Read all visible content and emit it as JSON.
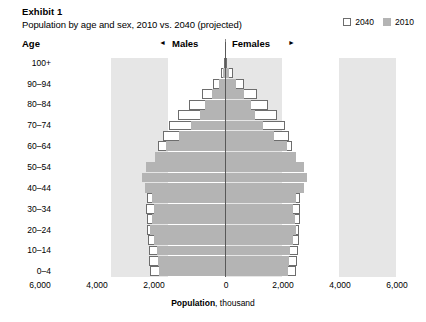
{
  "header": {
    "exhibit": "Exhibit 1",
    "subtitle": "Population by age and sex, 2010 vs. 2040 (projected)"
  },
  "legend": {
    "position": "top-right",
    "items": [
      {
        "label": "2040",
        "style": "outline",
        "color": "#ffffff",
        "border": "#6d6d6d"
      },
      {
        "label": "2010",
        "style": "filled",
        "color": "#b4b4b4"
      }
    ]
  },
  "axis_header": {
    "age_label": "Age",
    "males_label": "Males",
    "females_label": "Females",
    "left_arrow": "◄",
    "right_arrow": "►"
  },
  "xaxis": {
    "title_bold": "Population",
    "title_rest": ", thousand",
    "ticks": [
      "6,000",
      "4,000",
      "2,000",
      "0",
      "2,000",
      "4,000",
      "6,000"
    ],
    "tick_values": [
      -6000,
      -4000,
      -2000,
      0,
      2000,
      4000,
      6000
    ],
    "tick_px": [
      40,
      97,
      154,
      226,
      283,
      340,
      397
    ]
  },
  "yaxis": {
    "label": "Age",
    "visible_ticks": [
      "100+",
      "90–94",
      "80–84",
      "70–74",
      "60–64",
      "50–54",
      "40–44",
      "30–34",
      "20–24",
      "10–14",
      "0–4"
    ]
  },
  "chart_data": {
    "type": "bar",
    "subtype": "population-pyramid",
    "title": "Population by age and sex, 2010 vs. 2040 (projected)",
    "xlabel": "Population, thousand",
    "ylabel": "Age",
    "xlim": [
      -6000,
      6000
    ],
    "grid": false,
    "legend_position": "top-right",
    "orientation": "horizontal-diverging",
    "units": "thousand",
    "categories": [
      "0–4",
      "5–9",
      "10–14",
      "15–19",
      "20–24",
      "25–29",
      "30–34",
      "35–39",
      "40–44",
      "45–49",
      "50–54",
      "55–59",
      "60–64",
      "65–69",
      "70–74",
      "75–79",
      "80–84",
      "85–89",
      "90–94",
      "95–99",
      "100+"
    ],
    "series": [
      {
        "name": "2010",
        "color": "#b4b4b4",
        "males": [
          2320,
          2360,
          2400,
          2500,
          2620,
          2560,
          2480,
          2560,
          2820,
          2900,
          2760,
          2440,
          2080,
          1600,
          1180,
          880,
          700,
          460,
          220,
          70,
          14
        ],
        "females": [
          2210,
          2250,
          2290,
          2380,
          2490,
          2450,
          2400,
          2500,
          2780,
          2880,
          2780,
          2500,
          2180,
          1720,
          1320,
          1060,
          920,
          680,
          380,
          140,
          32
        ]
      },
      {
        "name": "2040",
        "color": "#ffffff",
        "males": [
          2620,
          2660,
          2680,
          2700,
          2720,
          2740,
          2760,
          2720,
          2660,
          2580,
          2500,
          2420,
          2340,
          2180,
          1960,
          1640,
          1260,
          820,
          420,
          150,
          34
        ],
        "females": [
          2500,
          2540,
          2560,
          2580,
          2600,
          2620,
          2640,
          2620,
          2580,
          2520,
          2460,
          2400,
          2360,
          2260,
          2100,
          1840,
          1520,
          1120,
          660,
          280,
          78
        ]
      }
    ]
  }
}
